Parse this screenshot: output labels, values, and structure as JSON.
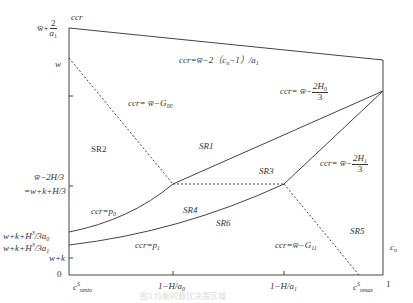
{
  "diagram": {
    "type": "region-partition",
    "axes": {
      "y_label": "ccr",
      "x_end_label": "c_n",
      "y_ticks": [
        {
          "id": "w_bar_plus_2_over_a1",
          "prefix": "w̅+",
          "frac_num": "2",
          "frac_den": "a",
          "frac_den_sub": "1"
        },
        {
          "id": "w",
          "label": "w"
        },
        {
          "id": "w_bar_minus_2H3",
          "label": "w̅−2H/3"
        },
        {
          "id": "eq_w_k_H3",
          "label": "=w+k+H/3"
        },
        {
          "id": "w_k_H0",
          "label": "w+k+H",
          "sup": "3",
          "tail": "/3a",
          "tail_sub": "0"
        },
        {
          "id": "w_k_H1",
          "label": "w+k+H",
          "sup": "3",
          "tail": "/3a",
          "tail_sub": "1"
        },
        {
          "id": "w_k",
          "label": "w+k"
        },
        {
          "id": "zero",
          "label": "0"
        }
      ],
      "x_ticks": [
        {
          "id": "cmin",
          "label": "c",
          "sup": "S",
          "sub": "nmin"
        },
        {
          "id": "one_minus_H_a0",
          "label": "1−H/a",
          "sub": "0"
        },
        {
          "id": "one_minus_H_a1",
          "label": "1−H/a",
          "sub": "1"
        },
        {
          "id": "cmax",
          "label": "c",
          "sup": "S",
          "sub": "nmax"
        },
        {
          "id": "one",
          "label": "1"
        }
      ]
    },
    "regions": [
      {
        "id": "SR1",
        "label": "SR1"
      },
      {
        "id": "SR2",
        "label": "SR2"
      },
      {
        "id": "SR3",
        "label": "SR3"
      },
      {
        "id": "SR4",
        "label": "SR4"
      },
      {
        "id": "SR5",
        "label": "SR5"
      },
      {
        "id": "SR6",
        "label": "SR6"
      }
    ],
    "curve_labels": {
      "top": {
        "pre": "ccr=w̅−2（c",
        "sub": "n",
        "post": "−1）/a",
        "sub2": "1"
      },
      "g00": {
        "pre": "ccr= w̅−G",
        "sub": "00"
      },
      "h0": {
        "pre": "ccr= w̅−",
        "num": "2H",
        "num_sub": "0",
        "den": "3"
      },
      "h1": {
        "pre": "ccr= w̅−",
        "num": "2H",
        "num_sub": "1",
        "den": "3"
      },
      "p0": {
        "pre": "ccr=p",
        "sub": "0"
      },
      "p1": {
        "pre": "ccr=p",
        "sub": "1"
      },
      "g11": {
        "pre": "ccr=w̅−G",
        "sub": "11"
      }
    },
    "caption": "图3 均衡的最优决策区域"
  }
}
